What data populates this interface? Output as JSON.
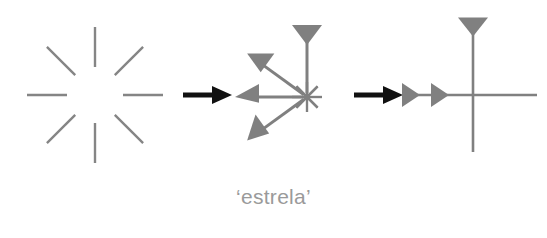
{
  "page": {
    "background_color": "#ffffff",
    "width": 547,
    "height": 238
  },
  "caption": {
    "text": "‘estrela’",
    "color": "#9a9a9a"
  },
  "colors": {
    "stroke_gray": "#808080",
    "stroke_gray_light": "#8c8c8c",
    "arrow_black": "#111111",
    "caption_gray": "#9a9a9a"
  },
  "figures": [
    {
      "id": "starburst",
      "name": "eight-ray-starburst",
      "label": "starburst",
      "description": "Eight short gray radial line segments arranged at 45 degree intervals around an empty center",
      "center": {
        "x": 95,
        "y": 95
      },
      "ray_count": 8,
      "ray_inner_radius": 28,
      "ray_outer_radius": 68,
      "ray_angles_deg": [
        0,
        45,
        90,
        135,
        180,
        225,
        270,
        315
      ],
      "stroke_width": 2.4,
      "color": "#858585"
    },
    {
      "id": "asterisk-with-arrows",
      "name": "asterisk-with-three-arrowheads",
      "label": "asterisk with arrows",
      "description": "Star/asterisk of eight short strokes at the center, with three long gray rays ending in solid triangular arrowheads pointing up, upper-left and lower-left",
      "center": {
        "x": 307,
        "y": 97
      },
      "hub_radius": 15,
      "hub_stroke_width": 2.2,
      "color": "#808080",
      "rays": [
        {
          "name": "ray-up",
          "angle_deg": 90,
          "length": 72,
          "arrowhead": "funnel-down",
          "arrow_width": 30,
          "arrow_height": 20
        },
        {
          "name": "ray-upper-left",
          "angle_deg": 144,
          "length": 74,
          "arrowhead": "triangle",
          "arrow_width": 32,
          "arrow_height": 22
        },
        {
          "name": "ray-left",
          "angle_deg": 180,
          "length": 72,
          "arrowhead": "triangle",
          "arrow_width": 26,
          "arrow_height": 24
        },
        {
          "name": "ray-lower-left",
          "angle_deg": 216,
          "length": 74,
          "arrowhead": "triangle",
          "arrow_width": 32,
          "arrow_height": 22
        }
      ]
    },
    {
      "id": "cross-with-arrows",
      "name": "cross-with-arrowheads",
      "label": "cross with arrows",
      "description": "Gray vertical and horizontal lines crossing, with a funnel-shaped downward triangle at the top and two solid right-pointing triangles on the left part of the horizontal line",
      "center": {
        "x": 473,
        "y": 95
      },
      "color": "#808080",
      "stroke_width": 2.6,
      "vertical": {
        "top": 25,
        "bottom": 152
      },
      "horizontal": {
        "left": 408,
        "right": 537
      },
      "markers": [
        {
          "name": "top-funnel-triangle",
          "x": 473,
          "y": 27,
          "width": 30,
          "height": 19,
          "direction": "down"
        },
        {
          "name": "left-outer-triangle",
          "x": 411,
          "y": 95,
          "width": 18,
          "height": 24,
          "direction": "right"
        },
        {
          "name": "left-inner-triangle",
          "x": 440,
          "y": 95,
          "width": 18,
          "height": 24,
          "direction": "right"
        }
      ]
    }
  ],
  "connectors": [
    {
      "id": "arrow-1",
      "name": "transform-arrow-1",
      "label": "transformation arrow one",
      "from": "starburst",
      "to": "asterisk-with-arrows",
      "x1": 183,
      "y1": 95,
      "x2": 232,
      "y2": 95,
      "color": "#111111",
      "shaft_width": 5,
      "head_width": 20,
      "head_height": 18
    },
    {
      "id": "arrow-2",
      "name": "transform-arrow-2",
      "label": "transformation arrow two",
      "from": "asterisk-with-arrows",
      "to": "cross-with-arrows",
      "x1": 354,
      "y1": 95,
      "x2": 403,
      "y2": 95,
      "color": "#111111",
      "shaft_width": 5,
      "head_width": 20,
      "head_height": 18
    }
  ]
}
